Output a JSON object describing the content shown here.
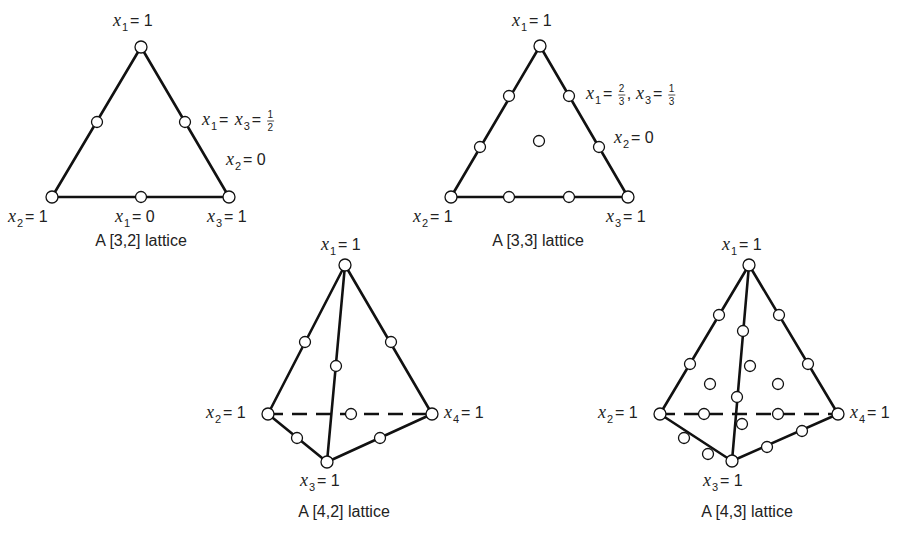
{
  "figure": {
    "background": "#ffffff",
    "stroke_color": "#111111",
    "lattices": [
      {
        "id": "lattice-3-2",
        "caption": "A [3,2] lattice",
        "caption_pos": [
          141,
          246
        ],
        "solid_edges": [
          [
            [
              141,
              47
            ],
            [
              52,
              197
            ]
          ],
          [
            [
              141,
              47
            ],
            [
              229,
              197
            ]
          ],
          [
            [
              52,
              197
            ],
            [
              229,
              197
            ]
          ]
        ],
        "dashed_edges": [],
        "nodes": [
          [
            141,
            47
          ],
          [
            52,
            197
          ],
          [
            229,
            197
          ],
          [
            97,
            122
          ],
          [
            185,
            122
          ],
          [
            141,
            197
          ]
        ],
        "labels": [
          {
            "var": "x",
            "sub": "1",
            "rest": " = 1",
            "pos": [
              113,
              26
            ]
          },
          {
            "var": "x",
            "sub": "2",
            "rest": " = 1",
            "pos": [
              8,
              222
            ]
          },
          {
            "var": "x",
            "sub": "1",
            "rest": " = 0",
            "pos": [
              115,
              222
            ]
          },
          {
            "var": "x",
            "sub": "3",
            "rest": " = 1",
            "pos": [
              207,
              222
            ]
          },
          {
            "var": "x",
            "sub": "2",
            "rest": " = 0",
            "pos": [
              226,
              165
            ]
          }
        ],
        "fraction_labels": [
          {
            "text": "x1 = x3 = 1/2",
            "pos": [
              202,
              125
            ],
            "parts": [
              {
                "var": "x",
                "sub": "1"
              },
              {
                "op": " = "
              },
              {
                "var": "x",
                "sub": "3"
              },
              {
                "op": " = "
              },
              {
                "num": "1",
                "den": "2"
              }
            ]
          }
        ]
      },
      {
        "id": "lattice-3-3",
        "caption": "A [3,3] lattice",
        "caption_pos": [
          538,
          246
        ],
        "solid_edges": [
          [
            [
              540,
              46
            ],
            [
              451,
              197
            ]
          ],
          [
            [
              540,
              46
            ],
            [
              628,
              197
            ]
          ],
          [
            [
              451,
              197
            ],
            [
              628,
              197
            ]
          ]
        ],
        "dashed_edges": [],
        "nodes": [
          [
            540,
            46
          ],
          [
            451,
            197
          ],
          [
            628,
            197
          ],
          [
            509,
            96
          ],
          [
            480,
            147
          ],
          [
            569,
            96
          ],
          [
            599,
            147
          ],
          [
            509,
            197
          ],
          [
            569,
            197
          ],
          [
            539,
            141
          ]
        ],
        "labels": [
          {
            "var": "x",
            "sub": "1",
            "rest": " = 1",
            "pos": [
              512,
              26
            ]
          },
          {
            "var": "x",
            "sub": "2",
            "rest": " = 1",
            "pos": [
              413,
              222
            ]
          },
          {
            "var": "x",
            "sub": "3",
            "rest": " = 1",
            "pos": [
              606,
              222
            ]
          },
          {
            "var": "x",
            "sub": "2",
            "rest": " = 0",
            "pos": [
              614,
              143
            ]
          }
        ],
        "fraction_labels": [
          {
            "text": "x1 = 2/3, x3 = 1/3",
            "pos": [
              586,
              99
            ],
            "parts": [
              {
                "var": "x",
                "sub": "1"
              },
              {
                "op": " = "
              },
              {
                "num": "2",
                "den": "3"
              },
              {
                "op": ", "
              },
              {
                "var": "x",
                "sub": "3"
              },
              {
                "op": " = "
              },
              {
                "num": "1",
                "den": "3"
              }
            ]
          }
        ]
      },
      {
        "id": "lattice-4-2",
        "caption": "A [4,2] lattice",
        "caption_pos": [
          344,
          517
        ],
        "solid_edges": [
          [
            [
              345,
              265
            ],
            [
              268,
              414
            ]
          ],
          [
            [
              345,
              265
            ],
            [
              432,
              414
            ]
          ],
          [
            [
              345,
              265
            ],
            [
              327,
              462
            ]
          ],
          [
            [
              268,
              414
            ],
            [
              327,
              462
            ]
          ],
          [
            [
              327,
              462
            ],
            [
              432,
              414
            ]
          ]
        ],
        "dashed_edges": [
          [
            [
              268,
              414
            ],
            [
              432,
              414
            ]
          ]
        ],
        "nodes": [
          [
            345,
            265
          ],
          [
            268,
            414
          ],
          [
            432,
            414
          ],
          [
            327,
            462
          ],
          [
            305,
            342
          ],
          [
            391,
            342
          ],
          [
            336,
            366
          ],
          [
            351,
            414
          ],
          [
            297,
            438
          ],
          [
            380,
            438
          ]
        ],
        "labels": [
          {
            "var": "x",
            "sub": "1",
            "rest": " = 1",
            "pos": [
              321,
              250
            ]
          },
          {
            "var": "x",
            "sub": "2",
            "rest": " = 1",
            "pos": [
              206,
              418
            ]
          },
          {
            "var": "x",
            "sub": "4",
            "rest": " = 1",
            "pos": [
              444,
              418
            ]
          },
          {
            "var": "x",
            "sub": "3",
            "rest": " = 1",
            "pos": [
              300,
              486
            ]
          }
        ],
        "fraction_labels": []
      },
      {
        "id": "lattice-4-3",
        "caption": "A [4,3] lattice",
        "caption_pos": [
          747,
          517
        ],
        "solid_edges": [
          [
            [
              749,
              265
            ],
            [
              660,
              414
            ]
          ],
          [
            [
              749,
              265
            ],
            [
              838,
              414
            ]
          ],
          [
            [
              749,
              265
            ],
            [
              732,
              461
            ]
          ],
          [
            [
              660,
              414
            ],
            [
              732,
              461
            ]
          ],
          [
            [
              732,
              461
            ],
            [
              838,
              414
            ]
          ]
        ],
        "dashed_edges": [
          [
            [
              660,
              414
            ],
            [
              838,
              414
            ]
          ]
        ],
        "nodes": [
          [
            749,
            265
          ],
          [
            660,
            414
          ],
          [
            838,
            414
          ],
          [
            732,
            461
          ],
          [
            719,
            315
          ],
          [
            690,
            364
          ],
          [
            779,
            315
          ],
          [
            808,
            364
          ],
          [
            743,
            331
          ],
          [
            737,
            397
          ],
          [
            684,
            438
          ],
          [
            708,
            454
          ],
          [
            767,
            447
          ],
          [
            802,
            431
          ],
          [
            704,
            414
          ],
          [
            778,
            414
          ],
          [
            750,
            366
          ],
          [
            710,
            384
          ],
          [
            778,
            384
          ],
          [
            742,
            424
          ]
        ],
        "labels": [
          {
            "var": "x",
            "sub": "1",
            "rest": " = 1",
            "pos": [
              722,
              250
            ]
          },
          {
            "var": "x",
            "sub": "2",
            "rest": " = 1",
            "pos": [
              598,
              418
            ]
          },
          {
            "var": "x",
            "sub": "4",
            "rest": " = 1",
            "pos": [
              850,
              418
            ]
          },
          {
            "var": "x",
            "sub": "3",
            "rest": " = 1",
            "pos": [
              703,
              486
            ]
          }
        ],
        "fraction_labels": []
      }
    ]
  }
}
